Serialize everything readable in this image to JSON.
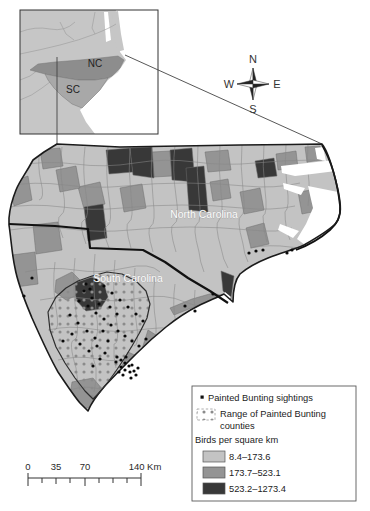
{
  "figure": {
    "inset": {
      "nc": "NC",
      "sc": "SC"
    },
    "compass": {
      "n": "N",
      "e": "E",
      "s": "S",
      "w": "W"
    },
    "map_labels": {
      "north_carolina": "North Carolina",
      "south_carolina": "South Carolina"
    },
    "scalebar": {
      "labels": [
        "0",
        "35",
        "70",
        "140 Km"
      ]
    },
    "legend": {
      "sightings": "Painted Bunting sightings",
      "range_line1": "Range of Painted Bunting",
      "range_line2": "counties",
      "density_title": "Birds per square km",
      "classes": [
        {
          "label": "8.4–173.6",
          "color": "#c3c3c3"
        },
        {
          "label": "173.7–523.1",
          "color": "#949494"
        },
        {
          "label": "523.2–1273.4",
          "color": "#383838"
        }
      ]
    },
    "colors": {
      "land": "#c3c3c3",
      "mid": "#949494",
      "high": "#383838",
      "water": "#ffffff",
      "inset_nc": "#8d8d8d",
      "inset_sc": "#a8a8a8",
      "inset_land": "#c6c6c6"
    }
  }
}
